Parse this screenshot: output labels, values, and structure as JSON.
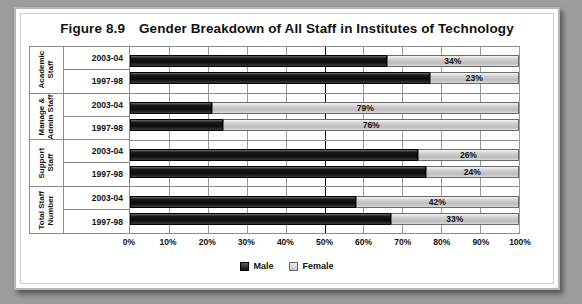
{
  "figure": {
    "number": "Figure 8.9",
    "title": "Gender Breakdown of All Staff in Institutes of Technology"
  },
  "legend": {
    "male_label": "Male",
    "female_label": "Female"
  },
  "colors": {
    "male": "#111111",
    "female": "#c8c8c8",
    "grid": "#9a9a9a",
    "axis": "#000000",
    "frame": "#b6b6b6",
    "page_background": "#9c9c9c"
  },
  "axis": {
    "ticks": [
      "0%",
      "10%",
      "20%",
      "30%",
      "40%",
      "50%",
      "60%",
      "70%",
      "80%",
      "90%",
      "100%"
    ],
    "major_tick": "50%"
  },
  "groups": [
    {
      "name": "Academic Staff",
      "rows": [
        {
          "label": "2003-04",
          "male": 66,
          "female": 34,
          "female_text": "34%"
        },
        {
          "label": "1997-98",
          "male": 77,
          "female": 23,
          "female_text": "23%"
        }
      ]
    },
    {
      "name": "Manage & Admin Staff",
      "rows": [
        {
          "label": "2003-04",
          "male": 21,
          "female": 79,
          "female_text": "79%"
        },
        {
          "label": "1997-98",
          "male": 24,
          "female": 76,
          "female_text": "76%"
        }
      ]
    },
    {
      "name": "Support Staff",
      "rows": [
        {
          "label": "2003-04",
          "male": 74,
          "female": 26,
          "female_text": "26%"
        },
        {
          "label": "1997-98",
          "male": 76,
          "female": 24,
          "female_text": "24%"
        }
      ]
    },
    {
      "name": "Total Staff Number",
      "rows": [
        {
          "label": "2003-04",
          "male": 58,
          "female": 42,
          "female_text": "42%"
        },
        {
          "label": "1997-98",
          "male": 67,
          "female": 33,
          "female_text": "33%"
        }
      ]
    }
  ],
  "chart_data": {
    "type": "bar",
    "orientation": "horizontal",
    "stacked": true,
    "stacked_mode": "percent",
    "xlabel": "",
    "ylabel": "",
    "xlim": [
      0,
      100
    ],
    "xtick_labels": [
      "0%",
      "10%",
      "20%",
      "30%",
      "40%",
      "50%",
      "60%",
      "70%",
      "80%",
      "90%",
      "100%"
    ],
    "grid": true,
    "legend_position": "bottom",
    "categories": [
      "Academic Staff 2003-04",
      "Academic Staff 1997-98",
      "Manage & Admin Staff 2003-04",
      "Manage & Admin Staff 1997-98",
      "Support Staff 2003-04",
      "Support Staff 1997-98",
      "Total Staff Number 2003-04",
      "Total Staff Number 1997-98"
    ],
    "series": [
      {
        "name": "Male",
        "values": [
          66,
          77,
          21,
          24,
          74,
          76,
          58,
          67
        ]
      },
      {
        "name": "Female",
        "values": [
          34,
          23,
          79,
          76,
          26,
          24,
          42,
          33
        ]
      }
    ],
    "data_labels": [
      "34%",
      "23%",
      "79%",
      "76%",
      "26%",
      "24%",
      "42%",
      "33%"
    ],
    "note": "Only the Female segment is labelled on each bar."
  }
}
